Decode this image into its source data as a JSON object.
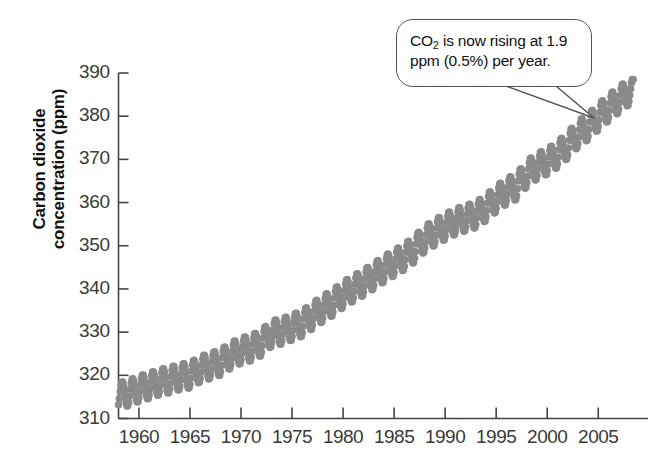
{
  "figure": {
    "background": "#ffffff",
    "marker_color": "#8a8a8a",
    "axis_color": "#444444",
    "callout_border_color": "#555555"
  },
  "callout": {
    "name": "annotation-callout",
    "text_line1_a": "CO",
    "text_line1_sub": "2",
    "text_line1_b": " is now rising at 1.9",
    "text_line2": "ppm (0.5%) per year.",
    "full_text": "CO2 is now rising at 1.9 ppm (0.5%) per year.",
    "rate_ppm_per_year": 1.9,
    "rate_percent_per_year": 0.5,
    "pointer_target_year": 2002,
    "pointer_target_value": 373
  },
  "chart_data": {
    "type": "scatter",
    "title": "",
    "subtitle": "",
    "xlabel": "",
    "ylabel": "Carbon dioxide concentration (ppm)",
    "ylabel_line1": "Carbon dioxide",
    "ylabel_line2": "concentration (ppm)",
    "xlim": [
      1958,
      2008.6
    ],
    "ylim": [
      310,
      390
    ],
    "grid": false,
    "legend": "none",
    "marker": "circle",
    "marker_size_px": 7.5,
    "series_name": "Monthly mean atmospheric CO2 (Mauna Loa)",
    "xticks": [
      1960,
      1965,
      1970,
      1975,
      1980,
      1985,
      1990,
      1995,
      2000,
      2005
    ],
    "xtick_labels": [
      "1960",
      "1965",
      "1970",
      "1975",
      "1980",
      "1985",
      "1990",
      "1995",
      "2000",
      "2005"
    ],
    "yticks": [
      310,
      320,
      330,
      340,
      350,
      360,
      370,
      380,
      390
    ],
    "ytick_labels": [
      "310",
      "320",
      "330",
      "340",
      "350",
      "360",
      "370",
      "380",
      "390"
    ],
    "seasonal_amplitude_ppm": 3.0,
    "seasonal_peak_month": 5,
    "annual_means": {
      "years": [
        1958,
        1959,
        1960,
        1961,
        1962,
        1963,
        1964,
        1965,
        1966,
        1967,
        1968,
        1969,
        1970,
        1971,
        1972,
        1973,
        1974,
        1975,
        1976,
        1977,
        1978,
        1979,
        1980,
        1981,
        1982,
        1983,
        1984,
        1985,
        1986,
        1987,
        1988,
        1989,
        1990,
        1991,
        1992,
        1993,
        1994,
        1995,
        1996,
        1997,
        1998,
        1999,
        2000,
        2001,
        2002,
        2003,
        2004,
        2005,
        2006,
        2007,
        2008
      ],
      "values": [
        315.3,
        315.9,
        316.9,
        317.6,
        318.4,
        318.9,
        319.6,
        320.0,
        321.4,
        322.2,
        323.0,
        324.6,
        325.7,
        326.3,
        327.5,
        329.7,
        330.2,
        331.1,
        332.0,
        333.8,
        335.4,
        336.8,
        338.7,
        340.1,
        341.4,
        343.0,
        344.6,
        346.0,
        347.4,
        349.2,
        351.6,
        353.1,
        354.4,
        355.6,
        356.4,
        357.1,
        358.8,
        360.8,
        362.6,
        363.7,
        366.7,
        368.4,
        369.5,
        371.1,
        373.2,
        375.8,
        377.5,
        379.8,
        381.9,
        383.8,
        385.6
      ]
    }
  }
}
